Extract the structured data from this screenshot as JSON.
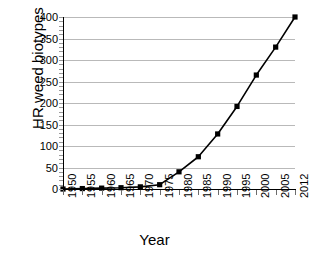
{
  "chart_data": {
    "type": "line",
    "title": "",
    "xlabel": "Year",
    "ylabel": "HR weed biotypes",
    "categories": [
      "1950",
      "1955",
      "1960",
      "1965",
      "1970",
      "1975",
      "1980",
      "1985",
      "1990",
      "1995",
      "2000",
      "2005",
      "2012"
    ],
    "values": [
      0,
      1,
      2,
      3,
      5,
      10,
      40,
      75,
      128,
      192,
      265,
      330,
      400
    ],
    "series": [
      {
        "name": "HR weed biotypes",
        "values": [
          0,
          1,
          2,
          3,
          5,
          10,
          40,
          75,
          128,
          192,
          265,
          330,
          400
        ]
      }
    ],
    "ylim": [
      0,
      400
    ],
    "yticks": [
      "0",
      "50",
      "100",
      "150",
      "200",
      "250",
      "300",
      "350",
      "400"
    ],
    "ytick_values": [
      0,
      50,
      100,
      150,
      200,
      250,
      300,
      350,
      400
    ],
    "grid": "horizontal",
    "legend": "none",
    "marker": "square",
    "marker_color": "#000000",
    "line_color": "#000000",
    "gridline_color": "#b9b9b9",
    "axis_color": "#000000",
    "background_color": "#ffffff"
  }
}
